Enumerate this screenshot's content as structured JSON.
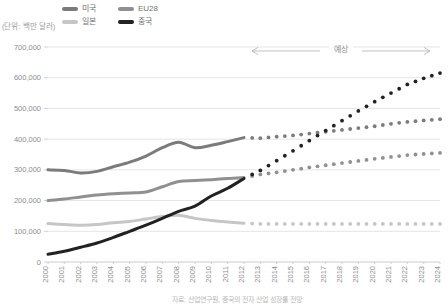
{
  "unit_caption": "(단위: 백만 달러)",
  "source_caption": "자료: 산업연구원, 중국의 전자 산업 성장률 전망",
  "forecast": {
    "label": "예상",
    "start_year": 2012,
    "end_year": 2024
  },
  "legend": {
    "items": [
      {
        "label": "미국",
        "color": "#7b7b7b"
      },
      {
        "label": "EU28",
        "color": "#909090"
      },
      {
        "label": "일본",
        "color": "#c6c6c6"
      },
      {
        "label": "중국",
        "color": "#222222"
      }
    ]
  },
  "chart_data": {
    "type": "line",
    "title": "",
    "subtitle": "",
    "xlabel": "",
    "ylabel": "",
    "unit": "백만 달러",
    "grid": true,
    "legend_position": "top",
    "ylim": [
      0,
      700000
    ],
    "ytick_step": 100000,
    "ytick_labels": [
      "0",
      "100,000",
      "200,000",
      "300,000",
      "400,000",
      "500,000",
      "600,000",
      "700,000"
    ],
    "ytick_values": [
      0,
      100000,
      200000,
      300000,
      400000,
      500000,
      600000,
      700000
    ],
    "x": [
      2000,
      2001,
      2002,
      2003,
      2004,
      2005,
      2006,
      2007,
      2008,
      2009,
      2010,
      2011,
      2012,
      2013,
      2014,
      2015,
      2016,
      2017,
      2018,
      2019,
      2020,
      2021,
      2022,
      2023,
      2024
    ],
    "xtick_labels": [
      "2000",
      "2001",
      "2002",
      "2003",
      "2004",
      "2005",
      "2006",
      "2007",
      "2008",
      "2009",
      "2010",
      "2011",
      "2012",
      "2013",
      "2014",
      "2015",
      "2016",
      "2017",
      "2018",
      "2019",
      "2020",
      "2021",
      "2022",
      "2023",
      "2024"
    ],
    "actual_through": 2012,
    "series": [
      {
        "name": "미국",
        "color": "#7b7b7b",
        "style": "solid-then-dotted",
        "values": [
          300000,
          298000,
          290000,
          295000,
          310000,
          325000,
          345000,
          372000,
          390000,
          372000,
          380000,
          392000,
          405000,
          403000,
          408000,
          412000,
          418000,
          424000,
          430000,
          436000,
          442000,
          450000,
          456000,
          461000,
          465000
        ]
      },
      {
        "name": "EU28",
        "color": "#909090",
        "style": "solid-then-dotted",
        "values": [
          200000,
          205000,
          212000,
          218000,
          222000,
          225000,
          228000,
          245000,
          262000,
          265000,
          268000,
          272000,
          275000,
          285000,
          292000,
          300000,
          308000,
          315000,
          322000,
          329000,
          336000,
          342000,
          348000,
          352000,
          355000
        ]
      },
      {
        "name": "일본",
        "color": "#c6c6c6",
        "style": "solid-then-dotted",
        "values": [
          125000,
          122000,
          120000,
          122000,
          128000,
          132000,
          140000,
          148000,
          152000,
          142000,
          135000,
          130000,
          126000,
          124000,
          124000,
          124000,
          124000,
          124000,
          124000,
          124000,
          124000,
          124000,
          124000,
          124000,
          124000
        ]
      },
      {
        "name": "중국",
        "color": "#222222",
        "style": "solid-then-dotted",
        "values": [
          25000,
          35000,
          48000,
          62000,
          80000,
          100000,
          120000,
          142000,
          165000,
          182000,
          215000,
          240000,
          272000,
          298000,
          330000,
          362000,
          395000,
          428000,
          460000,
          492000,
          522000,
          550000,
          578000,
          598000,
          615000
        ]
      }
    ]
  }
}
